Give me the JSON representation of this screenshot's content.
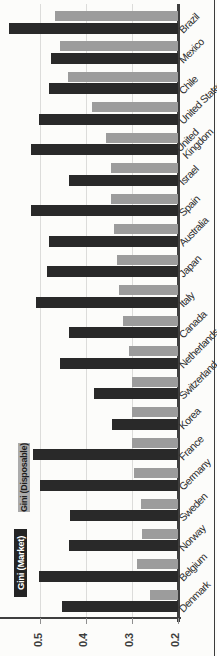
{
  "figure": {
    "background_color": "#fcfcfa",
    "edge_rule_color": "#3c3c3c"
  },
  "legend": {
    "market": {
      "label": "Gini (Market)",
      "swatch_color": "#242424",
      "text_color": "#ffffff"
    },
    "disposable": {
      "label": "Gini (Disposable)",
      "swatch_color": "#ababab",
      "text_color": "#1f1f1f"
    }
  },
  "axis": {
    "tick_labels": [
      "0.5",
      "0.4",
      "0.3",
      "0.2"
    ],
    "clipped_tick_label": "0.6",
    "tick_values": [
      0.5,
      0.4,
      0.3,
      0.2
    ],
    "gridline_values": [
      0.5,
      0.4,
      0.3
    ],
    "gridline_color": "#dcdcda",
    "axis_line_color": "#3f3f3f",
    "tick_text_color": "#3d3d3d",
    "country_text_color": "#2e2e2e"
  },
  "chart_data": {
    "type": "bar",
    "orientation": "figure rotated 90deg CCW: bars run right-to-left from baseline at 0.2; country labels on right edge at 45deg",
    "title": "",
    "xlabel": "",
    "ylabel": "",
    "value_axis": {
      "ticks": [
        0.2,
        0.3,
        0.4,
        0.5
      ],
      "lim": [
        0.2,
        0.6
      ],
      "grid": true
    },
    "legend_position": "left of axis labels (top of original unrotated chart)",
    "categories": [
      "Brazil",
      "Mexico",
      "Chile",
      "United States",
      "United Kingdom",
      "Israel",
      "Spain",
      "Australia",
      "Japan",
      "Italy",
      "Canada",
      "Netherlands",
      "Switzerland",
      "Korea",
      "France",
      "Germany",
      "Sweden",
      "Norway",
      "Belgium",
      "Denmark"
    ],
    "label_wrap": {
      "United Kingdom": [
        "United",
        "Kingdom"
      ]
    },
    "series": [
      {
        "name": "Gini (Disposable)",
        "color": "#9c9c9c",
        "values": [
          0.467,
          0.456,
          0.44,
          0.387,
          0.357,
          0.345,
          0.345,
          0.338,
          0.333,
          0.328,
          0.32,
          0.305,
          0.299,
          0.299,
          0.299,
          0.294,
          0.279,
          0.277,
          0.288,
          0.261
        ]
      },
      {
        "name": "Gini (Market)",
        "color": "#292929",
        "values": [
          0.569,
          0.476,
          0.481,
          0.502,
          0.52,
          0.438,
          0.521,
          0.481,
          0.485,
          0.509,
          0.436,
          0.456,
          0.383,
          0.344,
          0.516,
          0.5,
          0.434,
          0.436,
          0.503,
          0.453
        ]
      }
    ]
  }
}
